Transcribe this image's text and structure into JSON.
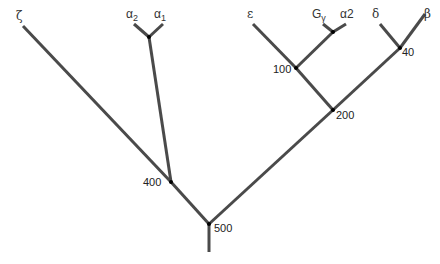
{
  "diagram": {
    "type": "phylogenetic-tree",
    "root_stub": {
      "x": 209,
      "y1": 224,
      "y2": 252
    },
    "nodes": [
      {
        "id": "n500",
        "label": "500",
        "x": 209,
        "y": 224,
        "label_dx": 5,
        "label_dy": 8
      },
      {
        "id": "n400",
        "label": "400",
        "x": 171,
        "y": 182,
        "label_dx": -28,
        "label_dy": 4
      },
      {
        "id": "nalpha",
        "label": "",
        "x": 149,
        "y": 37
      },
      {
        "id": "n200",
        "label": "200",
        "x": 333,
        "y": 110,
        "label_dx": 3,
        "label_dy": 9
      },
      {
        "id": "n100",
        "label": "100",
        "x": 296,
        "y": 68,
        "label_dx": -23,
        "label_dy": 5
      },
      {
        "id": "ngamma",
        "label": "",
        "x": 333,
        "y": 32
      },
      {
        "id": "n40",
        "label": "40",
        "x": 400,
        "y": 48,
        "label_dx": 2,
        "label_dy": 8
      }
    ],
    "leaves": [
      {
        "id": "zeta",
        "label": "ζ",
        "subscript": "",
        "x": 23,
        "y": 26,
        "label_x": 16,
        "label_y": 20
      },
      {
        "id": "alpha2",
        "label": "α",
        "subscript": "2",
        "x": 134,
        "y": 24,
        "label_x": 126,
        "label_y": 18
      },
      {
        "id": "alpha1",
        "label": "α",
        "subscript": "1",
        "x": 163,
        "y": 24,
        "label_x": 154,
        "label_y": 18
      },
      {
        "id": "epsilon",
        "label": "ε",
        "subscript": "",
        "x": 253,
        "y": 24,
        "label_x": 247,
        "label_y": 18
      },
      {
        "id": "ggamma",
        "label": "G",
        "subscript": "γ",
        "x": 323,
        "y": 24,
        "label_x": 312,
        "label_y": 18
      },
      {
        "id": "alpha2b",
        "label": "α2",
        "subscript": "",
        "x": 346,
        "y": 24,
        "label_x": 340,
        "label_y": 18
      },
      {
        "id": "delta",
        "label": "δ",
        "subscript": "",
        "x": 380,
        "y": 24,
        "label_x": 372,
        "label_y": 18
      },
      {
        "id": "beta",
        "label": "β",
        "subscript": "",
        "x": 425,
        "y": 14,
        "label_x": 424,
        "label_y": 18
      }
    ],
    "edges": [
      {
        "from": "n500",
        "to": "n400"
      },
      {
        "from": "n400",
        "to": "zeta"
      },
      {
        "from": "n400",
        "to": "nalpha"
      },
      {
        "from": "nalpha",
        "to": "alpha2"
      },
      {
        "from": "nalpha",
        "to": "alpha1"
      },
      {
        "from": "n500",
        "to": "n200"
      },
      {
        "from": "n200",
        "to": "n100"
      },
      {
        "from": "n100",
        "to": "epsilon"
      },
      {
        "from": "n100",
        "to": "ngamma"
      },
      {
        "from": "ngamma",
        "to": "ggamma"
      },
      {
        "from": "ngamma",
        "to": "alpha2b"
      },
      {
        "from": "n200",
        "to": "n40"
      },
      {
        "from": "n40",
        "to": "delta"
      },
      {
        "from": "n40",
        "to": "beta"
      }
    ],
    "colors": {
      "branch": "#4a4a4a",
      "node": "#000000",
      "text": "#333333",
      "background": "#ffffff"
    }
  }
}
